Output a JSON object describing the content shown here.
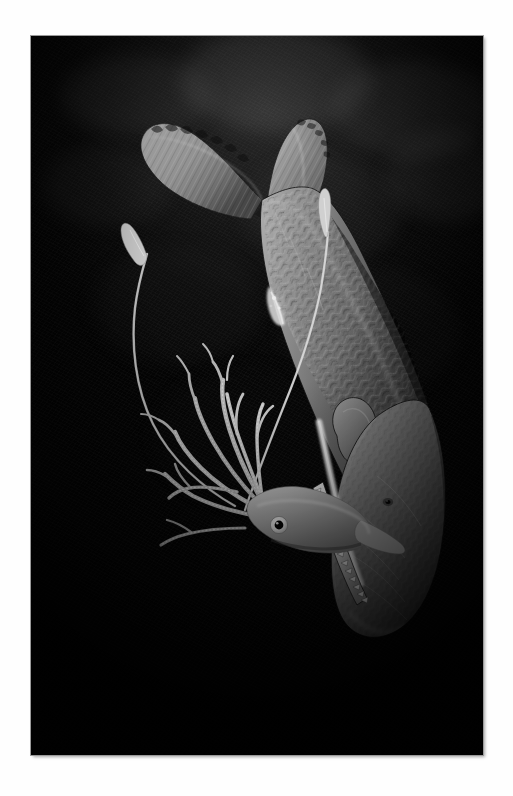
{
  "page": {
    "background_color": "#fefefe",
    "medium": "grayscale natural-history illustration plate",
    "orientation": "portrait"
  },
  "plate": {
    "name": "framed-illustration-plate",
    "frame_color": "#9a9a9a",
    "background_color": "#050505",
    "x": 31,
    "y": 36,
    "width": 452,
    "height": 719
  },
  "scene": {
    "title": "Sperm whale attacking a giant squid in the deep sea",
    "setting": "deep ocean / bathypelagic darkness",
    "palette": {
      "water_dark": "#050505",
      "water_mid": "#1a1a1a",
      "water_highlight": "#2b2b2b",
      "whale_body": "#8d8d8d",
      "whale_shadow": "#3a3a3a",
      "whale_highlight": "#c8c8c8",
      "squid_body": "#b9b9b9",
      "squid_highlight": "#e8e8e8",
      "teeth_white": "#f2f2f2",
      "eye_black": "#0a0a0a"
    }
  },
  "subjects": [
    {
      "id": "sperm-whale",
      "label": "Sperm whale",
      "common_name": "Sperm whale",
      "pose": "diving head-down, body angled from upper-left to lower-right",
      "parts": [
        {
          "name": "tail-flukes",
          "label": "Tail flukes",
          "note": "scalloped trailing edge, upper left"
        },
        {
          "name": "caudal-peduncle",
          "label": "Tail stock"
        },
        {
          "name": "body",
          "label": "Body",
          "note": "wrinkled prune-like skin texture"
        },
        {
          "name": "dorsal-ridge",
          "label": "Dorsal hump and knuckles"
        },
        {
          "name": "flipper",
          "label": "Pectoral flipper",
          "note": "small paddle near mid-body"
        },
        {
          "name": "head",
          "label": "Blunt squared head / spermaceti organ"
        },
        {
          "name": "eye",
          "label": "Eye",
          "note": "small dark eye set low on head"
        },
        {
          "name": "lower-jaw",
          "label": "Narrow lower jaw"
        },
        {
          "name": "teeth",
          "label": "Row of conical teeth",
          "count_visible": 14
        }
      ]
    },
    {
      "id": "giant-squid",
      "label": "Giant squid",
      "common_name": "Giant squid",
      "pose": "arms flared, mantle pointed toward whale's jaw, two long tentacles streaming upward",
      "parts": [
        {
          "name": "mantle",
          "label": "Mantle"
        },
        {
          "name": "eye",
          "label": "Large eye",
          "note": "prominent white ring with black pupil"
        },
        {
          "name": "arms",
          "label": "Eight arms",
          "count": 8
        },
        {
          "name": "feeding-tentacles",
          "label": "Two long feeding tentacles",
          "count": 2,
          "note": "whip-like, ending in spatulate clubs; one curls to upper left, one crosses the whale's body"
        }
      ]
    }
  ]
}
